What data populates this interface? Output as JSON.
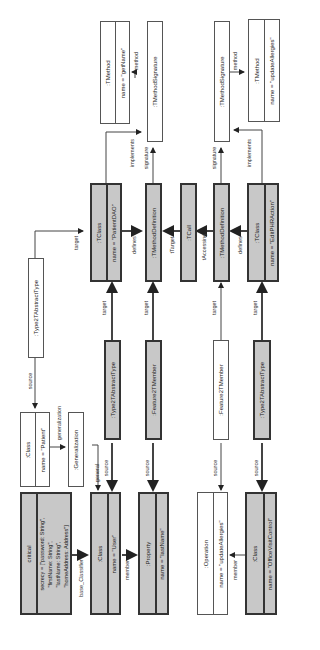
{
  "nodes": {
    "tmethod_getname": {
      "title": ":TMethod",
      "attr": "name = \"getName\""
    },
    "tmethodsig_top": {
      "title": ":TMethodSignature"
    },
    "tmethodsig_bottom": {
      "title": ":TMethodSignature"
    },
    "tmethod_updateallergies": {
      "title": ":TMethod",
      "attr": "name = \"updateAllergies\""
    },
    "tclass_patientdao": {
      "title": ":TClass",
      "attr": "name = \"PatientDAO\""
    },
    "tmethoddef_top": {
      "title": ":TMethodDefinition"
    },
    "tcall": {
      "title": ":TCall"
    },
    "tmethoddef_bottom": {
      "title": ":TMethodDefinition"
    },
    "tclass_editphraction": {
      "title": ":TClass",
      "attr": "name = \"EditPHRAction\""
    },
    "type2t_white": {
      "title": ":Type2TAbstractType"
    },
    "class_patient": {
      "title": ":Class",
      "attr": "name = \"Patient\""
    },
    "generalization": {
      "title": ":Generalization"
    },
    "type2t_gray_top": {
      "title": ":Type2TAbstractType"
    },
    "feature2t_gray": {
      "title": ":Feature2TMember"
    },
    "feature2t_white": {
      "title": ":Feature2TMember"
    },
    "type2t_gray_bottom": {
      "title": ":Type2TAbstractType"
    },
    "critical": {
      "title": "critical",
      "attr": "secrecy = [\"password: String\",\n  \"firstName: String\",\n  \"lastName: String\",\n  \"homeAddress: Address\"]"
    },
    "class_user": {
      "title": ":Class",
      "attr": "name = \"User\""
    },
    "property_lastname": {
      "title": ":Property",
      "attr": "name = \"lastName\""
    },
    "operation_updateallergies": {
      "title": ":Operation",
      "attr": "name = \"updateAllergies\""
    },
    "class_officevisitcontrol": {
      "title": ":Class",
      "attr": "name = \"OfficeVisitControl\""
    }
  },
  "edges": {
    "method_top": "method",
    "method_bottom": "method",
    "implements_top": "implements",
    "signature_top": "signature",
    "signature_bottom": "signature",
    "implements_bottom": "implements",
    "target_patientdao": "target",
    "defines_top": "defines",
    "ttarget": "tTarget",
    "taccessing": "tAccessing",
    "defines_bottom": "defines",
    "source_type2t": "source",
    "generalization": "generalization",
    "target_1": "target",
    "target_2": "target",
    "target_3": "target",
    "target_4": "target",
    "general": "general",
    "source_1": "source",
    "source_2": "source",
    "source_3": "source",
    "source_4": "source",
    "base_classifier": "base_Classifier",
    "member_1": "member",
    "member_2": "member"
  }
}
